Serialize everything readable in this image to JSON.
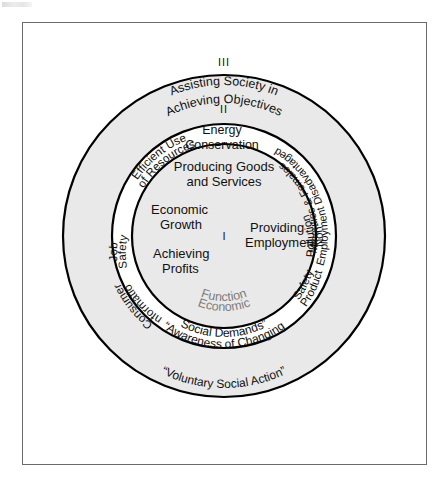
{
  "figure": {
    "background_color": "#ffffff",
    "frame_border_color": "#6b6b6b",
    "ring_fill_shaded": "#e9e9e9",
    "ring_fill_plain": "#ffffff",
    "stroke_color": "#000000",
    "gray_text_color": "#7d7d7d"
  },
  "rings": [
    {
      "id": "ring-1",
      "numeral": "I",
      "name": "Economic Function",
      "shaded": true,
      "labels": [
        "Producing Goods",
        "and Services",
        "Economic",
        "Growth",
        "Achieving",
        "Profits",
        "Providing",
        "Employment"
      ],
      "arc_label_lines": [
        "Economic",
        "Function"
      ]
    },
    {
      "id": "ring-2",
      "numeral": "II",
      "name": "Awareness of Changing Social Demands",
      "shaded": false,
      "arc_label_lines": [
        "“Awareness of Changing",
        "Social Demands”"
      ],
      "items": [
        {
          "line1": "Efficient Use",
          "line2": "of Resources"
        },
        {
          "line1": "Energy",
          "line2": "Conservation"
        },
        {
          "line1": "Employment Disadvantaged",
          "line2": "Minorities & Females"
        },
        {
          "line1": "Non-",
          "line2": "Pollution"
        },
        {
          "line1": "Product",
          "line2": "Safety"
        },
        {
          "line1": "Consumer",
          "line2": "Information"
        },
        {
          "line1": "Job",
          "line2": "Safety"
        }
      ]
    },
    {
      "id": "ring-3",
      "numeral": "III",
      "name": "Assisting Society in Achieving Objectives",
      "shaded": true,
      "top_label_lines": [
        "Assisting Society in",
        "Achieving Objectives"
      ],
      "bottom_label": "“Voluntary Social Action”"
    }
  ],
  "texts": {
    "numeral_1": "I",
    "numeral_2": "II",
    "numeral_3": "III",
    "producing_goods": "Producing Goods",
    "and_services": "and Services",
    "economic": "Economic",
    "growth": "Growth",
    "achieving": "Achieving",
    "profits": "Profits",
    "providing": "Providing",
    "employment": "Employment",
    "econ_func_1": "Economic",
    "econ_func_2": "Function",
    "awareness_1": "“Awareness of Changing",
    "awareness_2": "Social Demands”",
    "assisting_1": "Assisting Society in",
    "assisting_2": "Achieving Objectives",
    "voluntary": "“Voluntary Social Action”",
    "energy": "Energy",
    "conservation": "Conservation",
    "efficient_use": "Efficient Use",
    "of_resources": "of Resources",
    "emp_disadvantaged": "Employment Disadvantaged",
    "minorities_females": "Minorities & Females",
    "non": "Non-",
    "pollution": "Pollution",
    "product": "Product",
    "safety": "Safety",
    "consumer": "Consumer",
    "information": "Information",
    "job": "Job",
    "job_safety": "Safety"
  }
}
